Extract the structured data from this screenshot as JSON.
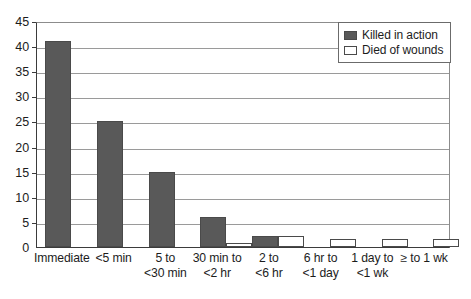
{
  "chart_data": {
    "type": "bar",
    "title": "",
    "subtitle": "",
    "xlabel": "",
    "ylabel": "",
    "ylim": [
      0,
      45
    ],
    "yticks": [
      0,
      5,
      10,
      15,
      20,
      25,
      30,
      35,
      40,
      45
    ],
    "grid": true,
    "legend_position": "top-right",
    "categories": [
      "Immediate",
      "<5 min",
      "5 to <30 min",
      "30 min to <2 hr",
      "2 to <6 hr",
      "6 hr to <1 day",
      "1 day to <1 wk",
      "≥ to 1 wk"
    ],
    "category_lines": [
      [
        "Immediate",
        ""
      ],
      [
        "<5 min",
        ""
      ],
      [
        "5 to",
        "<30 min"
      ],
      [
        "30 min to",
        "<2 hr"
      ],
      [
        "2 to",
        "<6 hr"
      ],
      [
        "6 hr to",
        "<1 day"
      ],
      [
        "1 day to",
        "<1 wk"
      ],
      [
        "≥ to 1 wk",
        ""
      ]
    ],
    "series": [
      {
        "name": "Killed in action",
        "color": "#595959",
        "values": [
          41,
          25,
          15,
          6,
          2.2,
          0,
          0,
          0
        ]
      },
      {
        "name": "Died of wounds",
        "color": "#ffffff",
        "values": [
          0,
          0,
          0,
          0.8,
          2.2,
          1.6,
          1.6,
          1.6
        ]
      }
    ]
  },
  "legend": {
    "items": [
      {
        "label": "Killed in action",
        "swatch": "killed"
      },
      {
        "label": "Died of wounds",
        "swatch": "wounds"
      }
    ]
  },
  "colors": {
    "killed_in_action": "#595959",
    "died_of_wounds": "#ffffff",
    "axis": "#3b3b3b",
    "gridline": "#9a9a9a",
    "text": "#1c1c1c"
  }
}
